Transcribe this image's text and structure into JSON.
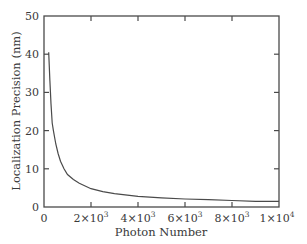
{
  "chart_data": {
    "type": "line",
    "title": "",
    "xlabel": "Photon Number",
    "ylabel": "Localization Precision (nm)",
    "xlim": [
      0,
      10000
    ],
    "ylim": [
      0,
      50
    ],
    "grid": false,
    "legend": null,
    "x_ticks": [
      0,
      2000,
      4000,
      6000,
      8000,
      10000
    ],
    "x_tick_labels": [
      "0",
      "2×10",
      "4×10",
      "6×10",
      "8×10",
      "1×10"
    ],
    "x_tick_exponents": [
      "",
      "3",
      "3",
      "3",
      "3",
      "4"
    ],
    "y_ticks": [
      0,
      10,
      20,
      30,
      40,
      50
    ],
    "y_tick_labels": [
      "0",
      "10",
      "20",
      "30",
      "40",
      "50"
    ],
    "series": [
      {
        "name": "Localization precision",
        "color": "#4a4a4a",
        "x": [
          200,
          250,
          300,
          350,
          400,
          500,
          600,
          700,
          850,
          1000,
          1250,
          1500,
          2000,
          2500,
          3000,
          4000,
          5000,
          6000,
          7000,
          8000,
          9000,
          10000
        ],
        "y": [
          40.5,
          33,
          27,
          22,
          20,
          16.5,
          14,
          12,
          10,
          8.5,
          7.2,
          6.2,
          4.8,
          4.0,
          3.5,
          2.8,
          2.4,
          2.1,
          1.9,
          1.7,
          1.5,
          1.5
        ]
      }
    ]
  }
}
